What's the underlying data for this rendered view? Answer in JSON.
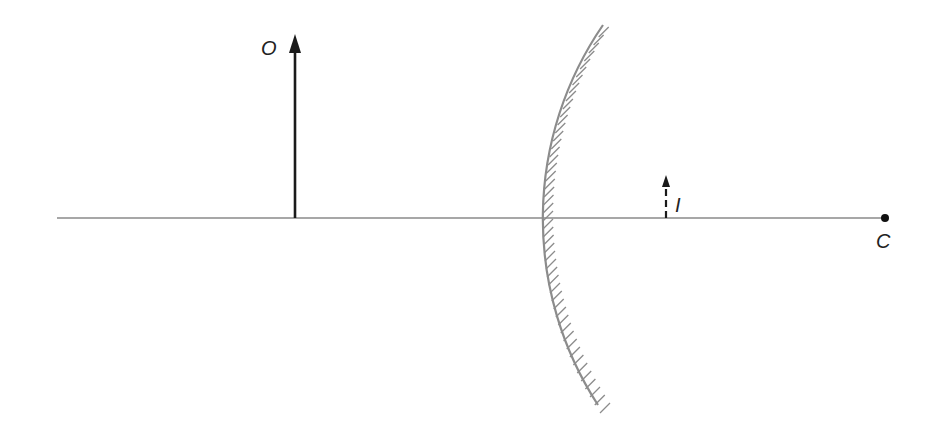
{
  "diagram": {
    "type": "concave-mirror-ray-diagram",
    "labels": {
      "object": "O",
      "image": "I",
      "center_of_curvature": "C"
    },
    "colors": {
      "axis": "#8a8a8a",
      "object_arrow": "#1a1a1a",
      "image_arrow": "#1a1a1a",
      "mirror": "#8c8c8c",
      "hatching": "#8c8c8c",
      "label": "#222222",
      "point_c": "#111111"
    },
    "elements": {
      "principal_axis": {
        "x1": 57,
        "x2": 885,
        "y": 218
      },
      "object_arrow": {
        "x": 295,
        "y_base": 218,
        "y_tip": 35,
        "style": "solid"
      },
      "image_arrow": {
        "x": 666,
        "y_base": 218,
        "y_tip": 176,
        "style": "dashed"
      },
      "mirror": {
        "center_x": 885,
        "center_y": 218,
        "radius": 342,
        "y_top": 25,
        "y_bottom": 405,
        "hatched_side": "back"
      },
      "point_c": {
        "x": 885,
        "y": 218
      }
    }
  }
}
